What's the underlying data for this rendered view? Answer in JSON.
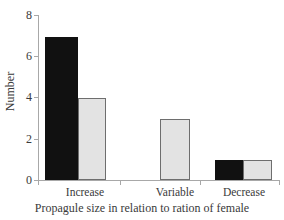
{
  "chart_data": {
    "type": "bar",
    "title": "",
    "subtitle": "",
    "xlabel": "Propagule size in relation to ration of female",
    "ylabel": "Number",
    "categories": [
      "Increase",
      "Variable",
      "Decrease"
    ],
    "series": [
      {
        "name": "series-dark",
        "color": "#111111",
        "values": [
          7,
          0,
          1
        ]
      },
      {
        "name": "series-light",
        "color": "#e3e3e3",
        "values": [
          4,
          3,
          1
        ]
      }
    ],
    "ylim": [
      0,
      8
    ],
    "yticks": [
      0,
      2,
      4,
      6,
      8
    ],
    "ytick_labels": [
      "0",
      "2",
      "4",
      "6",
      "8"
    ],
    "grid": false,
    "legend": "none",
    "annotations": []
  },
  "axis": {
    "y_title": "Number",
    "x_title": "Propagule size in relation to ration of female",
    "y_labels": {
      "t0": "0",
      "t2": "2",
      "t4": "4",
      "t6": "6",
      "t8": "8"
    },
    "x_labels": {
      "c0": "Increase",
      "c1": "Variable",
      "c2": "Decrease"
    }
  },
  "colors": {
    "dark_bar": "#111111",
    "light_bar": "#e3e3e3",
    "light_bar_edge": "#6e6e6e",
    "axis": "#a8a8a8",
    "text": "#3a3a3a",
    "background": "#ffffff"
  }
}
